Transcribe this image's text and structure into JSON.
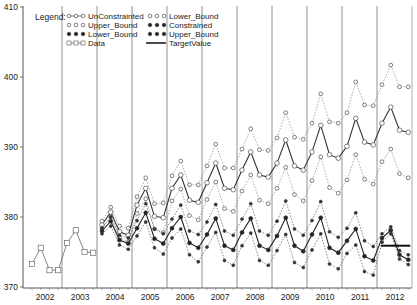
{
  "chart_data": {
    "type": "line",
    "title": "",
    "xlabel": "",
    "ylabel": "",
    "ylim": [
      370,
      410
    ],
    "yticks": [
      370,
      380,
      390,
      400,
      410
    ],
    "xticks": [
      "2002",
      "2003",
      "2004",
      "2005",
      "2006",
      "2007",
      "2008",
      "2009",
      "2010",
      "2011",
      "2012"
    ],
    "grid": "vertical year dividers",
    "legend": {
      "title": "Legend:",
      "position": "top-left inside",
      "entries": [
        {
          "label": "UnConstrainted",
          "style": "open-circle-solid-line"
        },
        {
          "label": "Upper_Bound",
          "style": "open-circle-dotted"
        },
        {
          "label": "Lower_Bound",
          "style": "filled-circle-dotted"
        },
        {
          "label": "Data",
          "style": "open-square-line"
        },
        {
          "label": "Lower_Bound",
          "style": "open-circle-dotted"
        },
        {
          "label": "Constrained",
          "style": "filled-circle-solid-line"
        },
        {
          "label": "Upper_Bound",
          "style": "filled-circle-dotted"
        },
        {
          "label": "TargetValue",
          "style": "thick-line"
        }
      ]
    },
    "x_start": "2002Q1",
    "frequency": "quarterly",
    "series": [
      {
        "name": "Data",
        "start_index": 0,
        "values": [
          373.3,
          375.6,
          372.4,
          372.4,
          376.3,
          378.1,
          375.0,
          374.9
        ]
      },
      {
        "name": "UnConstrainted",
        "start_index": 8,
        "values": [
          378.9,
          380.7,
          377.9,
          377.4,
          381.7,
          384.1,
          380.1,
          379.9,
          384.1,
          386.0,
          382.4,
          382.1,
          384.9,
          387.7,
          384.1,
          383.9,
          386.7,
          389.3,
          386.0,
          385.7,
          387.7,
          391.0,
          387.3,
          386.7,
          389.3,
          393.1,
          388.9,
          388.4,
          390.1,
          394.1,
          390.7,
          390.3,
          393.4,
          395.7,
          392.4,
          392.1
        ]
      },
      {
        "name": "Upper_Bound (UnConstrained)",
        "start_index": 8,
        "values": [
          379.4,
          381.4,
          378.7,
          378.4,
          382.9,
          385.6,
          381.9,
          382.0,
          385.9,
          388.0,
          384.6,
          384.6,
          387.3,
          390.4,
          387.0,
          387.0,
          389.7,
          392.6,
          389.6,
          389.5,
          391.3,
          394.9,
          391.4,
          391.1,
          393.4,
          397.6,
          393.6,
          393.4,
          394.9,
          399.3,
          396.0,
          395.9,
          398.9,
          401.7,
          398.6,
          398.6
        ]
      },
      {
        "name": "Lower_Bound (UnConstrained)",
        "start_index": 8,
        "values": [
          378.4,
          380.0,
          377.1,
          376.4,
          380.5,
          382.6,
          378.3,
          377.8,
          382.3,
          384.0,
          380.2,
          379.6,
          382.5,
          385.0,
          381.2,
          380.8,
          383.7,
          386.0,
          382.4,
          381.9,
          384.1,
          387.1,
          383.2,
          382.3,
          385.2,
          388.6,
          384.2,
          383.4,
          385.3,
          388.9,
          385.4,
          384.7,
          387.9,
          389.7,
          386.2,
          385.6
        ]
      },
      {
        "name": "Constrained",
        "start_index": 8,
        "values": [
          378.0,
          379.4,
          376.7,
          376.2,
          378.4,
          380.6,
          376.9,
          376.2,
          378.4,
          380.0,
          376.3,
          375.6,
          377.5,
          379.8,
          375.9,
          375.3,
          377.8,
          379.8,
          375.9,
          375.3,
          377.3,
          379.9,
          375.9,
          375.1,
          377.5,
          379.9,
          375.6,
          374.9,
          376.6,
          378.3,
          374.4,
          373.8,
          377.0,
          378.1,
          374.6,
          373.9
        ]
      },
      {
        "name": "Upper_Bound (Constrained)",
        "start_index": 8,
        "values": [
          378.4,
          380.0,
          377.4,
          377.0,
          379.5,
          381.9,
          378.3,
          377.6,
          379.7,
          381.7,
          378.0,
          377.5,
          379.3,
          381.8,
          378.0,
          377.4,
          379.7,
          381.9,
          378.0,
          377.4,
          379.4,
          382.3,
          378.3,
          377.4,
          379.5,
          382.2,
          377.9,
          377.1,
          378.4,
          380.6,
          376.6,
          375.8,
          377.6,
          378.6,
          375.2,
          374.6
        ]
      },
      {
        "name": "Lower_Bound (Constrained)",
        "start_index": 8,
        "values": [
          377.6,
          378.7,
          376.0,
          375.4,
          377.3,
          379.3,
          375.6,
          374.7,
          377.0,
          378.3,
          374.6,
          373.6,
          375.7,
          377.8,
          373.8,
          373.1,
          375.9,
          377.7,
          373.8,
          373.1,
          375.2,
          377.5,
          373.5,
          372.8,
          375.3,
          377.6,
          373.3,
          372.6,
          374.8,
          376.0,
          372.2,
          371.7,
          376.4,
          377.6,
          374.0,
          373.2
        ]
      },
      {
        "name": "TargetValue",
        "start_index": 40,
        "values": [
          375.9,
          375.9,
          375.9,
          375.9
        ]
      }
    ]
  },
  "axes": {
    "y_labels": [
      "410",
      "400",
      "390",
      "380",
      "370"
    ],
    "x_labels": [
      "2002",
      "2003",
      "2004",
      "2005",
      "2006",
      "2007",
      "2008",
      "2009",
      "2010",
      "2011",
      "2012"
    ]
  },
  "legend": {
    "title": "Legend:",
    "col1": [
      "UnConstrainted",
      "Upper_Bound",
      "Lower_Bound",
      "Data"
    ],
    "col2": [
      "Lower_Bound",
      "Constrained",
      "Upper_Bound",
      "TargetValue"
    ]
  }
}
